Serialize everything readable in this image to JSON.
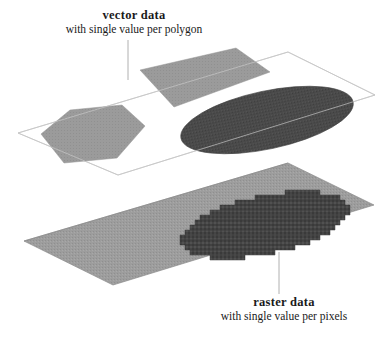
{
  "figure": {
    "name": "vector-vs-raster-data-diagram",
    "background_color": "#ffffff",
    "width": 388,
    "height": 338
  },
  "labels": {
    "vector": {
      "title": "vector data",
      "subtitle": "with single value per polygon"
    },
    "raster": {
      "title": "raster data",
      "subtitle": "with single value per pixels"
    }
  },
  "colors": {
    "plane_outline": "#b9b9b9",
    "plane_fill_upper": "#ffffff",
    "plane_fill_lower": "#9d9d9d",
    "polygon_gray": "#9d9d9d",
    "polygon_dark": "#4a4a4a",
    "raster_dark": "#444444",
    "leader_line": "#b0b0b0",
    "text": "#1a1a1a"
  },
  "planes": {
    "upper": {
      "label": "vector-plane",
      "points": "18,133 288,52 375,95 118,175"
    },
    "lower": {
      "label": "raster-plane",
      "points": "24,241 288,163 374,205 113,285"
    }
  },
  "shapes": {
    "hexagon": {
      "label": "vector-hexagon-polygon",
      "points": "41,134 70,110 122,105 145,126 117,158 64,163"
    },
    "quad": {
      "label": "vector-quad-polygon",
      "points": "140,70 236,48 270,72 174,107"
    },
    "ellipse_vector": {
      "label": "vector-ellipse-polygon",
      "cx": 267,
      "cy": 120,
      "rx": 88,
      "ry": 29,
      "rotate": -12
    },
    "ellipse_raster": {
      "label": "raster-ellipse-cells",
      "cx": 265,
      "cy": 225,
      "rx": 86,
      "ry": 29,
      "rotate": -12
    }
  },
  "leaders": {
    "vector": {
      "label": "vector-leader-line",
      "x1": 128,
      "y1": 40,
      "x2": 128,
      "y2": 80
    },
    "raster": {
      "label": "raster-leader-line",
      "x1": 279,
      "y1": 252,
      "x2": 279,
      "y2": 294
    }
  }
}
